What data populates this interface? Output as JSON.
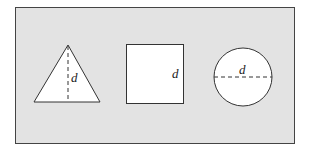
{
  "diagram": {
    "panel": {
      "background": "#e3e3e3",
      "border": "#444444"
    },
    "shapes": [
      {
        "type": "triangle",
        "dimension_label": "d",
        "dimension": "height"
      },
      {
        "type": "square",
        "dimension_label": "d",
        "dimension": "side"
      },
      {
        "type": "circle",
        "dimension_label": "d",
        "dimension": "diameter"
      }
    ]
  }
}
